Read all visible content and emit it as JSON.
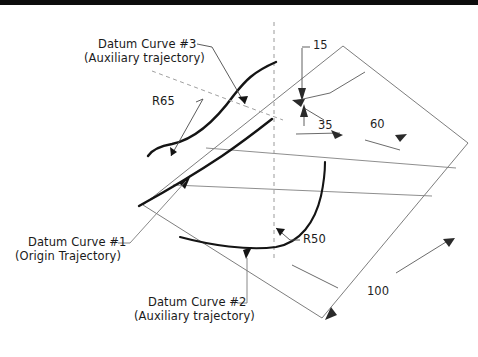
{
  "figure": {
    "type": "engineering-drawing",
    "background_color": "#ffffff",
    "line_color": "#1a1a1a",
    "thin_line_color": "#6e6e6e",
    "dashed_line_color": "#8c8c8c"
  },
  "annotations": {
    "datum3": {
      "line1": "Datum Curve #3",
      "line2": "(Auxiliary trajectory)"
    },
    "datum1": {
      "line1": "Datum Curve #1",
      "line2": "(Origin Trajectory)"
    },
    "datum2": {
      "line1": "Datum Curve #2",
      "line2": "(Auxiliary trajectory)"
    },
    "radius_r65": "R65",
    "radius_r50": "R50"
  },
  "dimensions": {
    "d15": "15",
    "d35": "35",
    "d60": "60",
    "d100": "100"
  }
}
